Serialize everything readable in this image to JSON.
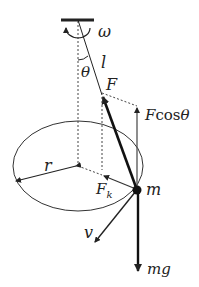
{
  "diagram": {
    "labels": {
      "omega": "ω",
      "length": "l",
      "theta": "θ",
      "force": "F",
      "vertical_component_F": "F",
      "vertical_component_cos": "cos",
      "vertical_component_theta": "θ",
      "radius": "r",
      "centripetal_F": "F",
      "centripetal_sub": "k",
      "mass": "m",
      "velocity": "v",
      "weight": "mg"
    },
    "colors": {
      "line": "#222222",
      "background": "#ffffff"
    }
  }
}
